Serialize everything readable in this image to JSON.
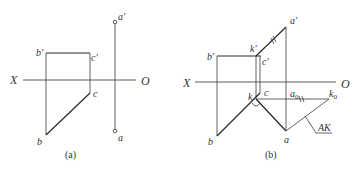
{
  "figures": [
    {
      "id": "a",
      "caption": "(a)",
      "labels": {
        "axis_x": "X",
        "axis_o": "O",
        "a_prime": "a'",
        "a": "a",
        "b_prime": "b'",
        "b": "b",
        "c_prime": "c'",
        "c": "c"
      }
    },
    {
      "id": "b",
      "caption": "(b)",
      "labels": {
        "axis_x": "X",
        "axis_o": "O",
        "a_prime": "a'",
        "a": "a",
        "b_prime": "b'",
        "b": "b",
        "c_prime": "c'",
        "c": "c",
        "k_prime": "k'",
        "k": "k",
        "a0": "a",
        "a0_sub": "0",
        "k0": "k",
        "k0_sub": "0",
        "true_length": "AK"
      }
    }
  ],
  "colors": {
    "line": "#2a2a2a",
    "text": "#333333",
    "background": "#ffffff"
  }
}
